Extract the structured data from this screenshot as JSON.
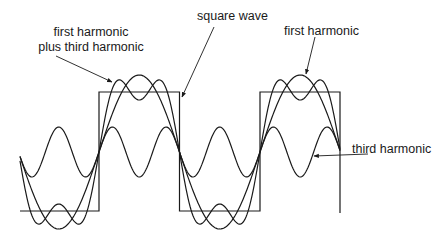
{
  "diagram": {
    "labels": {
      "sum": [
        "first harmonic",
        "plus third harmonic"
      ],
      "square": "square wave",
      "first": "first harmonic",
      "third": "third harmonic"
    },
    "geometry": {
      "x_start": 20,
      "x_end": 340,
      "midline_y": 152,
      "period_px": 161,
      "rising_edge_x": 99,
      "square_high_y": 92,
      "square_low_y": 211,
      "first_amplitude_px": 77,
      "third_amplitude_px": 25
    },
    "colors": {
      "stroke": "#1a1a1a",
      "background": "#ffffff"
    },
    "series": [
      {
        "name": "square wave",
        "type": "square"
      },
      {
        "name": "first harmonic",
        "type": "sine",
        "harmonic": 1
      },
      {
        "name": "third harmonic",
        "type": "sine",
        "harmonic": 3
      },
      {
        "name": "first harmonic plus third harmonic",
        "type": "sum",
        "harmonics": [
          1,
          3
        ]
      }
    ]
  }
}
